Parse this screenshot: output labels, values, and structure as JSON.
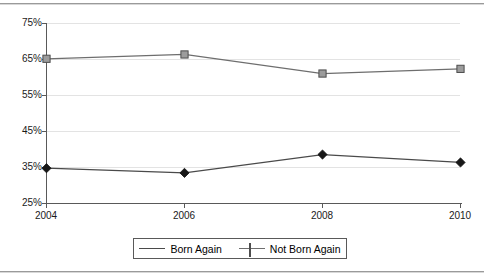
{
  "chart_data": {
    "type": "line",
    "title": "",
    "xlabel": "",
    "ylabel": "",
    "categories": [
      "2004",
      "2006",
      "2008",
      "2010"
    ],
    "x": [
      2004,
      2006,
      2008,
      2010
    ],
    "series": [
      {
        "name": "Born Again",
        "marker": "diamond",
        "color": "#171717",
        "values": [
          34.8,
          33.5,
          38.6,
          36.4
        ]
      },
      {
        "name": "Not Born Again",
        "marker": "square",
        "color": "#9c9c9c",
        "values": [
          65.2,
          66.4,
          61.1,
          62.4
        ]
      }
    ],
    "ylim": [
      25,
      75
    ],
    "yticks": [
      75,
      65,
      55,
      45,
      35,
      25
    ],
    "ytick_labels": [
      "75%",
      "65%",
      "55%",
      "45%",
      "35%",
      "25%"
    ],
    "xtick_labels": [
      "2004",
      "2006",
      "2008",
      "2010"
    ],
    "grid": true,
    "grid_axis": "y",
    "legend_position": "bottom-center"
  },
  "legend": {
    "entries": [
      {
        "label": "Born Again",
        "marker": "diamond-marker"
      },
      {
        "label": "Not Born Again",
        "marker": "square-marker"
      }
    ]
  },
  "axes": {
    "y_tick_labels": [
      "75%",
      "65%",
      "55%",
      "45%",
      "35%",
      "25%"
    ],
    "x_tick_labels": [
      "2004",
      "2006",
      "2008",
      "2010"
    ]
  },
  "colors": {
    "born_again": "#171717",
    "not_born_again": "#9c9c9c",
    "grid": "#e3e3e3",
    "axis": "#595959",
    "rule": "#9a9a9a"
  }
}
